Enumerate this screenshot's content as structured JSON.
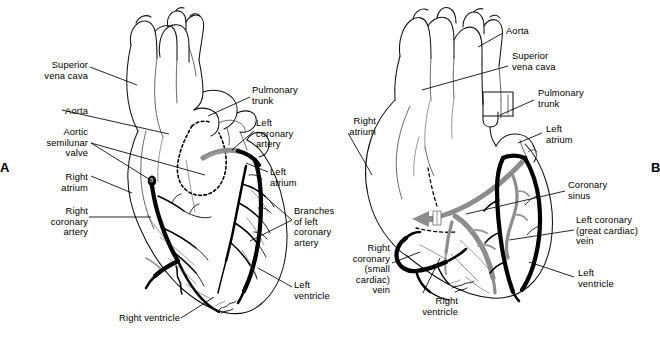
{
  "figure": {
    "background_color": "#ffffff",
    "ink_color": "#000000",
    "vein_color": "#8d8d8d",
    "width": 658,
    "height": 337
  },
  "panels": [
    {
      "id": "A",
      "letter": "A",
      "view": "anterior view showing coronary arteries",
      "labels": [
        {
          "key": "superior_vena_cava",
          "text": "Superior\nvena cava",
          "align": "right",
          "x": 10,
          "y": 60,
          "w": 78
        },
        {
          "key": "aorta",
          "text": "Aorta",
          "align": "right",
          "x": 10,
          "y": 106,
          "w": 78
        },
        {
          "key": "aortic_semilunar_valve",
          "text": "Aortic\nsemilunar\nvalve",
          "align": "right",
          "x": 6,
          "y": 127,
          "w": 82
        },
        {
          "key": "right_atrium",
          "text": "Right\natrium",
          "align": "right",
          "x": 10,
          "y": 172,
          "w": 78
        },
        {
          "key": "right_coronary_artery",
          "text": "Right\ncoronary\nartery",
          "align": "right",
          "x": 2,
          "y": 206,
          "w": 86
        },
        {
          "key": "right_ventricle",
          "text": "Right ventricle",
          "align": "right",
          "x": 90,
          "y": 315,
          "w": 90
        },
        {
          "key": "pulmonary_trunk",
          "text": "Pulmonary\ntrunk",
          "align": "left",
          "x": 252,
          "y": 85,
          "w": 80
        },
        {
          "key": "left_coronary_artery",
          "text": "Left\ncoronary\nartery",
          "align": "left",
          "x": 256,
          "y": 118,
          "w": 76
        },
        {
          "key": "left_atrium",
          "text": "Left\natrium",
          "align": "left",
          "x": 270,
          "y": 167,
          "w": 66
        },
        {
          "key": "branches_left_coronary_artery",
          "text": "Branches\nof left\ncoronary\nartery",
          "align": "left",
          "x": 294,
          "y": 206,
          "w": 72
        },
        {
          "key": "left_ventricle",
          "text": "Left\nventricle",
          "align": "left",
          "x": 294,
          "y": 280,
          "w": 70
        }
      ]
    },
    {
      "id": "B",
      "letter": "B",
      "view": "posterior view showing cardiac veins and coronary sinus",
      "labels": [
        {
          "key": "aorta",
          "text": "Aorta",
          "align": "left",
          "x": 506,
          "y": 26,
          "w": 72
        },
        {
          "key": "superior_vena_cava",
          "text": "Superior\nvena cava",
          "align": "left",
          "x": 512,
          "y": 51,
          "w": 80
        },
        {
          "key": "pulmonary_trunk",
          "text": "Pulmonary\ntrunk",
          "align": "left",
          "x": 538,
          "y": 88,
          "w": 80
        },
        {
          "key": "left_atrium",
          "text": "Left\natrium",
          "align": "left",
          "x": 546,
          "y": 124,
          "w": 66
        },
        {
          "key": "coronary_sinus",
          "text": "Coronary\nsinus",
          "align": "left",
          "x": 568,
          "y": 180,
          "w": 76
        },
        {
          "key": "left_coronary_great_cardiac_vein",
          "text": "Left coronary\n(great cardiac)\nvein",
          "align": "left",
          "x": 578,
          "y": 215,
          "w": 80
        },
        {
          "key": "left_ventricle",
          "text": "Left\nventricle",
          "align": "left",
          "x": 578,
          "y": 268,
          "w": 70
        },
        {
          "key": "right_atrium",
          "text": "Right\natrium",
          "align": "right",
          "x": 316,
          "y": 116,
          "w": 60
        },
        {
          "key": "right_coronary_small_cardiac_vein",
          "text": "Right\ncoronary\n(small\ncardiac)\nvein",
          "align": "right",
          "x": 334,
          "y": 247,
          "w": 56
        },
        {
          "key": "right_ventricle",
          "text": "Right\nventricle",
          "align": "right",
          "x": 398,
          "y": 296,
          "w": 60
        }
      ]
    }
  ]
}
